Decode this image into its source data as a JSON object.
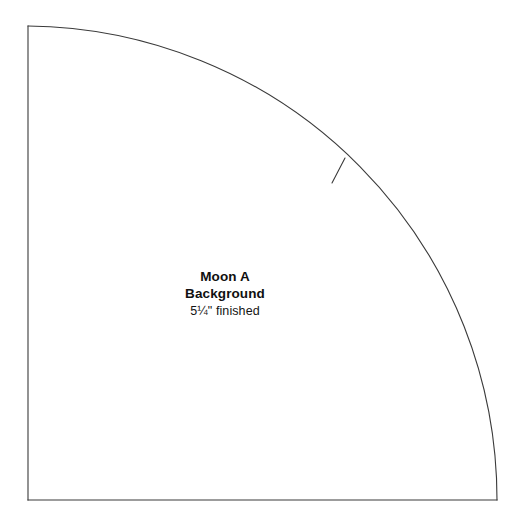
{
  "document": {
    "kind": "quilt-pattern-template",
    "background_color": "#ffffff",
    "line_color": "#3a3a3a",
    "text_color": "#101010"
  },
  "piece": {
    "name_line_1": "Moon A",
    "name_line_2": "Background",
    "finished_size": "5¼\" finished"
  },
  "geometry": {
    "corner_x": 28,
    "corner_y": 26,
    "bottom_y": 500,
    "right_x": 497,
    "arc_radius": 474,
    "arc_center_x": 28,
    "arc_center_y": 500,
    "stroke_width": "1"
  },
  "registration_mark": {
    "label": "notch",
    "arc_x": 343,
    "arc_y": 160,
    "inner_x": 333,
    "inner_y": 181
  }
}
